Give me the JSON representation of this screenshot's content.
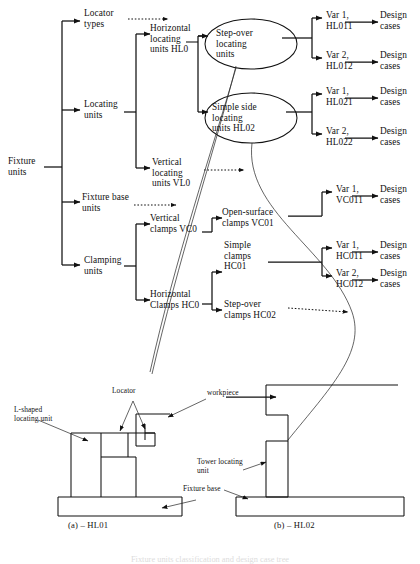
{
  "figure": {
    "caption": "Fixture units classification and design case tree",
    "subcaptions": {
      "left": "(a) – HL01",
      "right": "(b) – HL02"
    }
  },
  "tree": {
    "root": {
      "label": "Fixture\nunits"
    },
    "level1": [
      {
        "label": "Locator\ntypes"
      },
      {
        "label": "Locating\nunits"
      },
      {
        "label": "Fixture base\nunits"
      },
      {
        "label": "Clamping\nunits"
      }
    ],
    "level2": [
      {
        "label": "Horizontal\nlocating\nunits HL0"
      },
      {
        "label": "Vertical\nlocating\nunits VL0"
      },
      {
        "label": "Vertical\nclamps VC0"
      },
      {
        "label": "Horizontal\nClamps HC0"
      }
    ],
    "ellipses": [
      {
        "label": "Step-over\nlocating\nunits"
      },
      {
        "label": "Simple side\nlocating\nunits HL02"
      }
    ],
    "level3": [
      {
        "label": "Open-surface\nclamps VC01"
      },
      {
        "label": "Simple\nclamps\nHC01"
      },
      {
        "label": "Step-over\nclamps HC02"
      }
    ],
    "variants": [
      {
        "label": "Var 1,\nHL011"
      },
      {
        "label": "Var 2,\nHL012"
      },
      {
        "label": "Var 1,\nHL021"
      },
      {
        "label": "Var 2,\nHL022"
      },
      {
        "label": "Var 1,\nVC011"
      },
      {
        "label": "Var 1,\nHC011"
      },
      {
        "label": "Var 2,\nHC012"
      }
    ],
    "design_cases": [
      {
        "label": "Design\ncases"
      },
      {
        "label": "Design\ncases"
      },
      {
        "label": "Design\ncases"
      },
      {
        "label": "Design\ncases"
      },
      {
        "label": "Design\ncases"
      },
      {
        "label": "Design\ncases"
      },
      {
        "label": "Design\ncases"
      }
    ]
  },
  "drawings": {
    "left": {
      "labels": [
        {
          "key": "l_shaped",
          "text": "L-shaped\nlocating unit"
        },
        {
          "key": "locator",
          "text": "Locator"
        }
      ]
    },
    "right": {
      "labels": [
        {
          "key": "workpiece",
          "text": "workpiece"
        },
        {
          "key": "tower",
          "text": "Tower locating\nunit"
        },
        {
          "key": "fixture_base",
          "text": "Fixture base"
        }
      ]
    }
  },
  "colors": {
    "ink": "#111111",
    "paper": "#ffffff"
  }
}
